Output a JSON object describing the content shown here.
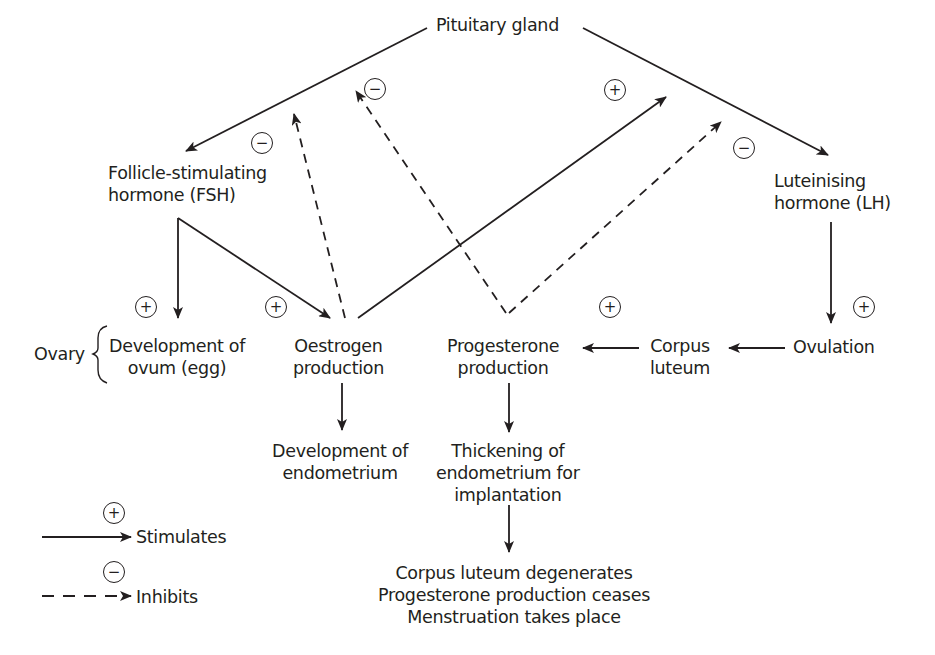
{
  "diagram": {
    "nodes": {
      "pituitary": "Pituitary gland",
      "fsh": [
        "Follicle-stimulating",
        "hormone (FSH)"
      ],
      "lh": [
        "Luteinising",
        "hormone (LH)"
      ],
      "ovary": "Ovary",
      "ovum": [
        "Development of",
        "ovum (egg)"
      ],
      "oestrogen": [
        "Oestrogen",
        "production"
      ],
      "progesterone": [
        "Progesterone",
        "production"
      ],
      "corpus_luteum": [
        "Corpus",
        "luteum"
      ],
      "ovulation": "Ovulation",
      "endometrium_dev": [
        "Development of",
        "endometrium"
      ],
      "thickening": [
        "Thickening of",
        "endometrium for",
        "implantation"
      ],
      "outcome": [
        "Corpus luteum degenerates",
        "Progesterone production ceases",
        "Menstruation takes place"
      ]
    },
    "signs": {
      "plus": "+",
      "minus": "−"
    },
    "edges": [
      {
        "from": "Pituitary gland",
        "to": "FSH",
        "type": "stimulates"
      },
      {
        "from": "Pituitary gland",
        "to": "LH",
        "type": "stimulates",
        "sign": "−"
      },
      {
        "from": "FSH",
        "to": "Development of ovum",
        "type": "stimulates",
        "sign": "+"
      },
      {
        "from": "FSH",
        "to": "Oestrogen production",
        "type": "stimulates",
        "sign": "+"
      },
      {
        "from": "Oestrogen production",
        "to": "Pituitary gland (FSH)",
        "type": "inhibits",
        "sign": "−"
      },
      {
        "from": "Oestrogen production",
        "to": "Pituitary gland (LH)",
        "type": "stimulates",
        "sign": "+"
      },
      {
        "from": "Progesterone production",
        "to": "Pituitary gland (FSH)",
        "type": "inhibits",
        "sign": "−"
      },
      {
        "from": "Progesterone production",
        "to": "Pituitary gland (LH)",
        "type": "inhibits",
        "sign": "−"
      },
      {
        "from": "LH",
        "to": "Ovulation",
        "type": "stimulates",
        "sign": "+"
      },
      {
        "from": "Ovulation",
        "to": "Corpus luteum",
        "type": "stimulates"
      },
      {
        "from": "Corpus luteum",
        "to": "Progesterone production",
        "type": "stimulates",
        "sign": "+"
      },
      {
        "from": "Oestrogen production",
        "to": "Development of endometrium",
        "type": "stimulates"
      },
      {
        "from": "Progesterone production",
        "to": "Thickening of endometrium",
        "type": "stimulates"
      },
      {
        "from": "Thickening of endometrium",
        "to": "Corpus luteum degenerates",
        "type": "stimulates"
      }
    ]
  },
  "legend": {
    "stimulates_sign": "+",
    "stimulates_label": "Stimulates",
    "inhibits_sign": "−",
    "inhibits_label": "Inhibits",
    "background": "#d9d9d9"
  },
  "colors": {
    "ink": "#231f20",
    "background": "#ffffff"
  }
}
